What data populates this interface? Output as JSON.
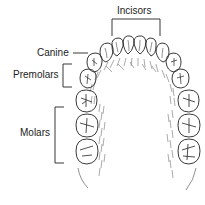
{
  "diagram": {
    "labels": {
      "incisors": "Incisors",
      "canine": "Canine",
      "premolars": "Premolars",
      "molars": "Molars"
    },
    "colors": {
      "ink": "#222222",
      "background": "#ffffff",
      "shading": "#555555"
    }
  }
}
